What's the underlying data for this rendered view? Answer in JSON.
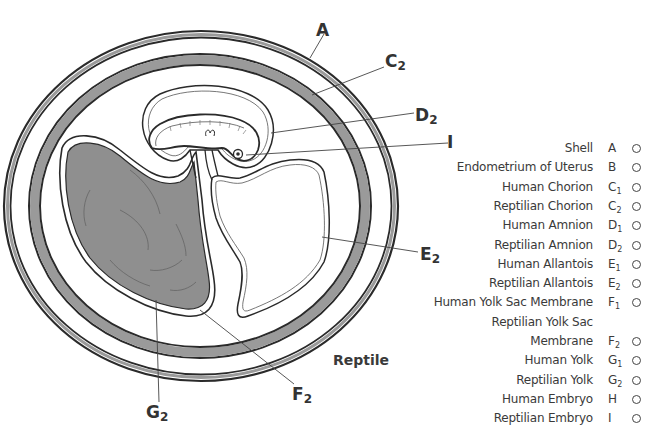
{
  "diagram": {
    "title": "Reptile",
    "colors": {
      "band_fill": "#9a9a9a",
      "yolk_fill": "#8f8f8f",
      "line": "#2a2a2a",
      "background": "#ffffff"
    },
    "callouts": [
      {
        "id": "A",
        "letter": "A",
        "sub": "",
        "x": 316,
        "y": 22
      },
      {
        "id": "C2",
        "letter": "C",
        "sub": "2",
        "x": 385,
        "y": 53
      },
      {
        "id": "D2",
        "letter": "D",
        "sub": "2",
        "x": 415,
        "y": 107
      },
      {
        "id": "I",
        "letter": "I",
        "sub": "",
        "x": 447,
        "y": 134
      },
      {
        "id": "E2",
        "letter": "E",
        "sub": "2",
        "x": 420,
        "y": 246
      },
      {
        "id": "F2",
        "letter": "F",
        "sub": "2",
        "x": 292,
        "y": 386
      },
      {
        "id": "G2",
        "letter": "G",
        "sub": "2",
        "x": 146,
        "y": 404
      }
    ]
  },
  "legend": {
    "items": [
      {
        "term": "Shell",
        "letter": "A",
        "sub": "",
        "has_check": true
      },
      {
        "term": "Endometrium of Uterus",
        "letter": "B",
        "sub": "",
        "has_check": true
      },
      {
        "term": "Human Chorion",
        "letter": "C",
        "sub": "1",
        "has_check": true
      },
      {
        "term": "Reptilian Chorion",
        "letter": "C",
        "sub": "2",
        "has_check": true
      },
      {
        "term": "Human Amnion",
        "letter": "D",
        "sub": "1",
        "has_check": true
      },
      {
        "term": "Reptilian Amnion",
        "letter": "D",
        "sub": "2",
        "has_check": true
      },
      {
        "term": "Human Allantois",
        "letter": "E",
        "sub": "1",
        "has_check": true
      },
      {
        "term": "Reptilian Allantois",
        "letter": "E",
        "sub": "2",
        "has_check": true
      },
      {
        "term": "Human Yolk Sac Membrane",
        "letter": "F",
        "sub": "1",
        "has_check": true
      },
      {
        "term": "Reptilian Yolk Sac",
        "letter": "",
        "sub": "",
        "has_check": false
      },
      {
        "term": "Membrane",
        "letter": "F",
        "sub": "2",
        "has_check": true
      },
      {
        "term": "Human Yolk",
        "letter": "G",
        "sub": "1",
        "has_check": true
      },
      {
        "term": "Reptilian Yolk",
        "letter": "G",
        "sub": "2",
        "has_check": true
      },
      {
        "term": "Human Embryo",
        "letter": "H",
        "sub": "",
        "has_check": true
      },
      {
        "term": "Reptilian Embryo",
        "letter": "I",
        "sub": "",
        "has_check": true
      }
    ]
  }
}
